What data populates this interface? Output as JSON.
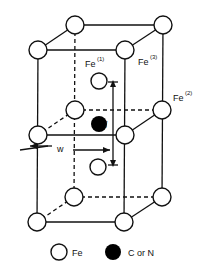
{
  "diagram": {
    "title": "",
    "labels": {
      "fe1": "Fe",
      "fe1_sup": "(1)",
      "fe3": "Fe",
      "fe3_sup": "(3)",
      "fe2": "Fe",
      "fe2_sup": "(2)",
      "l": "l",
      "w": "w"
    },
    "legend": [
      {
        "symbol": "open-circle",
        "label": "Fe"
      },
      {
        "symbol": "filled-circle",
        "label": "C or N"
      }
    ],
    "colors": {
      "line": "#111111",
      "atom_fill": "#ffffff",
      "interstitial_fill": "#000000"
    }
  }
}
